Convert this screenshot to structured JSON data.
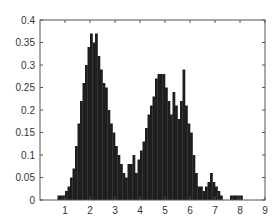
{
  "chart_data": {
    "type": "bar",
    "title": "",
    "xlabel": "",
    "ylabel": "",
    "xlim": [
      0,
      9
    ],
    "ylim": [
      0,
      0.4
    ],
    "grid": false,
    "legend": null,
    "bar_color": "#1e1e1e",
    "bin_width": 0.1,
    "x_ticks": [
      1,
      2,
      3,
      4,
      5,
      6,
      7,
      8,
      9
    ],
    "x_tick_labels": [
      "1",
      "2",
      "3",
      "4",
      "5",
      "6",
      "7",
      "8",
      "9"
    ],
    "y_ticks": [
      0,
      0.05,
      0.1,
      0.15,
      0.2,
      0.25,
      0.3,
      0.35,
      0.4
    ],
    "y_tick_labels": [
      "0",
      "0.05",
      "0.1",
      "0.15",
      "0.2",
      "0.25",
      "0.3",
      "0.35",
      "0.4"
    ],
    "x": [
      0.7,
      0.8,
      0.9,
      1.0,
      1.1,
      1.2,
      1.3,
      1.4,
      1.5,
      1.6,
      1.7,
      1.8,
      1.9,
      2.0,
      2.1,
      2.2,
      2.3,
      2.4,
      2.5,
      2.6,
      2.7,
      2.8,
      2.9,
      3.0,
      3.1,
      3.2,
      3.3,
      3.4,
      3.5,
      3.6,
      3.7,
      3.8,
      3.9,
      4.0,
      4.1,
      4.2,
      4.3,
      4.4,
      4.5,
      4.6,
      4.7,
      4.8,
      4.9,
      5.0,
      5.1,
      5.2,
      5.3,
      5.4,
      5.5,
      5.6,
      5.7,
      5.8,
      5.9,
      6.0,
      6.1,
      6.2,
      6.3,
      6.4,
      6.5,
      6.6,
      6.7,
      6.8,
      6.9,
      7.0,
      7.1,
      7.2,
      7.6,
      7.7,
      7.8,
      7.9,
      8.0
    ],
    "values": [
      0.01,
      0.01,
      0.01,
      0.02,
      0.03,
      0.05,
      0.07,
      0.12,
      0.17,
      0.22,
      0.26,
      0.3,
      0.34,
      0.37,
      0.35,
      0.37,
      0.32,
      0.29,
      0.26,
      0.25,
      0.2,
      0.17,
      0.15,
      0.12,
      0.1,
      0.08,
      0.06,
      0.05,
      0.08,
      0.08,
      0.1,
      0.06,
      0.09,
      0.11,
      0.13,
      0.16,
      0.19,
      0.21,
      0.23,
      0.27,
      0.28,
      0.28,
      0.28,
      0.25,
      0.22,
      0.19,
      0.24,
      0.21,
      0.18,
      0.22,
      0.29,
      0.21,
      0.17,
      0.15,
      0.1,
      0.06,
      0.03,
      0.03,
      0.02,
      0.03,
      0.04,
      0.06,
      0.04,
      0.03,
      0.02,
      0.01,
      0.01,
      0.01,
      0.01,
      0.01,
      0.01
    ]
  }
}
